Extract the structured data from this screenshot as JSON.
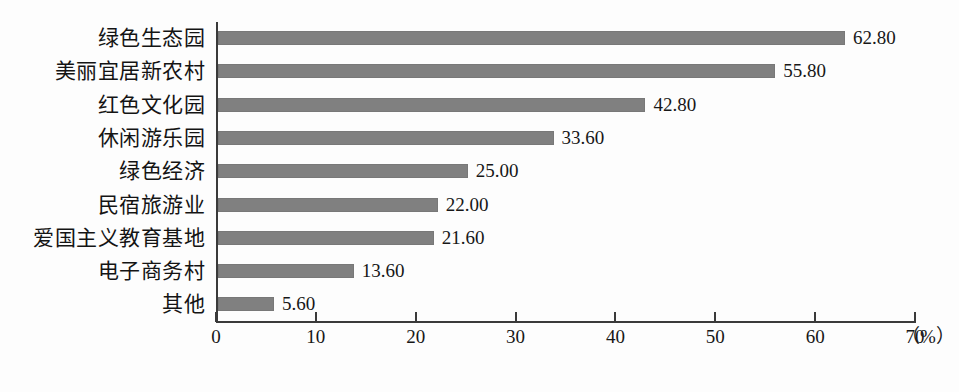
{
  "chart_data": {
    "type": "bar",
    "orientation": "horizontal",
    "title": "",
    "xlabel": "(%)",
    "ylabel": "",
    "xlim": [
      0,
      70
    ],
    "grid": false,
    "legend": null,
    "bar_color": "#808080",
    "axis_color": "#3a3a3a",
    "xticks": [
      "0",
      "10",
      "20",
      "30",
      "40",
      "50",
      "60",
      "70"
    ],
    "xtick_values": [
      0,
      10,
      20,
      30,
      40,
      50,
      60,
      70
    ],
    "unit_label": "（%）",
    "categories": [
      "绿色生态园",
      "美丽宜居新农村",
      "红色文化园",
      "休闲游乐园",
      "绿色经济",
      "民宿旅游业",
      "爱国主义教育基地",
      "电子商务村",
      "其他"
    ],
    "values": [
      62.8,
      55.8,
      42.8,
      33.6,
      25.0,
      22.0,
      21.6,
      13.6,
      5.6
    ],
    "value_labels": [
      "62.80",
      "55.80",
      "42.80",
      "33.60",
      "25.00",
      "22.00",
      "21.60",
      "13.60",
      "5.60"
    ]
  }
}
